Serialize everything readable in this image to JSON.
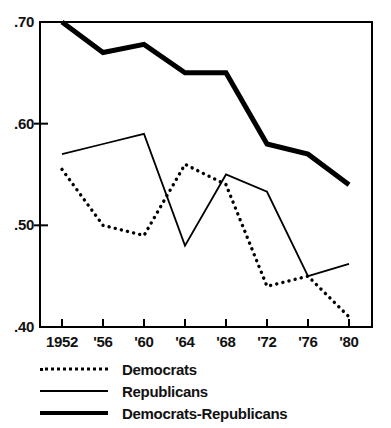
{
  "chart_data": {
    "type": "line",
    "title": "",
    "subtitle": "",
    "xlabel": "",
    "ylabel": "",
    "categories": [
      "1952",
      "'56",
      "'60",
      "'64",
      "'68",
      "'72",
      "'76",
      "'80"
    ],
    "x_tick_labels": [
      "1952",
      "'56",
      "'60",
      "'64",
      "'68",
      "'72",
      "'76",
      "'80"
    ],
    "y_tick_labels": [
      ".70",
      ".60",
      ".50",
      ".40"
    ],
    "y_tick_values": [
      0.7,
      0.6,
      0.5,
      0.4
    ],
    "xlim": [
      1952,
      1980
    ],
    "ylim": [
      0.4,
      0.7
    ],
    "grid": false,
    "legend_position": "below-axes",
    "series": [
      {
        "name": "Democrats",
        "style": "dotted",
        "color": "#000000",
        "values": [
          0.555,
          0.5,
          0.49,
          0.56,
          0.54,
          0.44,
          0.45,
          0.41
        ]
      },
      {
        "name": "Republicans",
        "style": "solid-thin",
        "color": "#000000",
        "values": [
          0.57,
          0.58,
          0.59,
          0.48,
          0.55,
          0.533,
          0.45,
          0.462
        ]
      },
      {
        "name": "Democrats-Republicans",
        "style": "solid-thick",
        "color": "#000000",
        "values": [
          0.7,
          0.67,
          0.678,
          0.65,
          0.65,
          0.58,
          0.57,
          0.54
        ]
      }
    ]
  },
  "legend": {
    "items": [
      {
        "label": "Democrats",
        "style": "dotted"
      },
      {
        "label": "Republicans",
        "style": "solid-thin"
      },
      {
        "label": "Democrats-Republicans",
        "style": "solid-thick"
      }
    ]
  },
  "axes": {
    "frame_color": "#000000"
  }
}
